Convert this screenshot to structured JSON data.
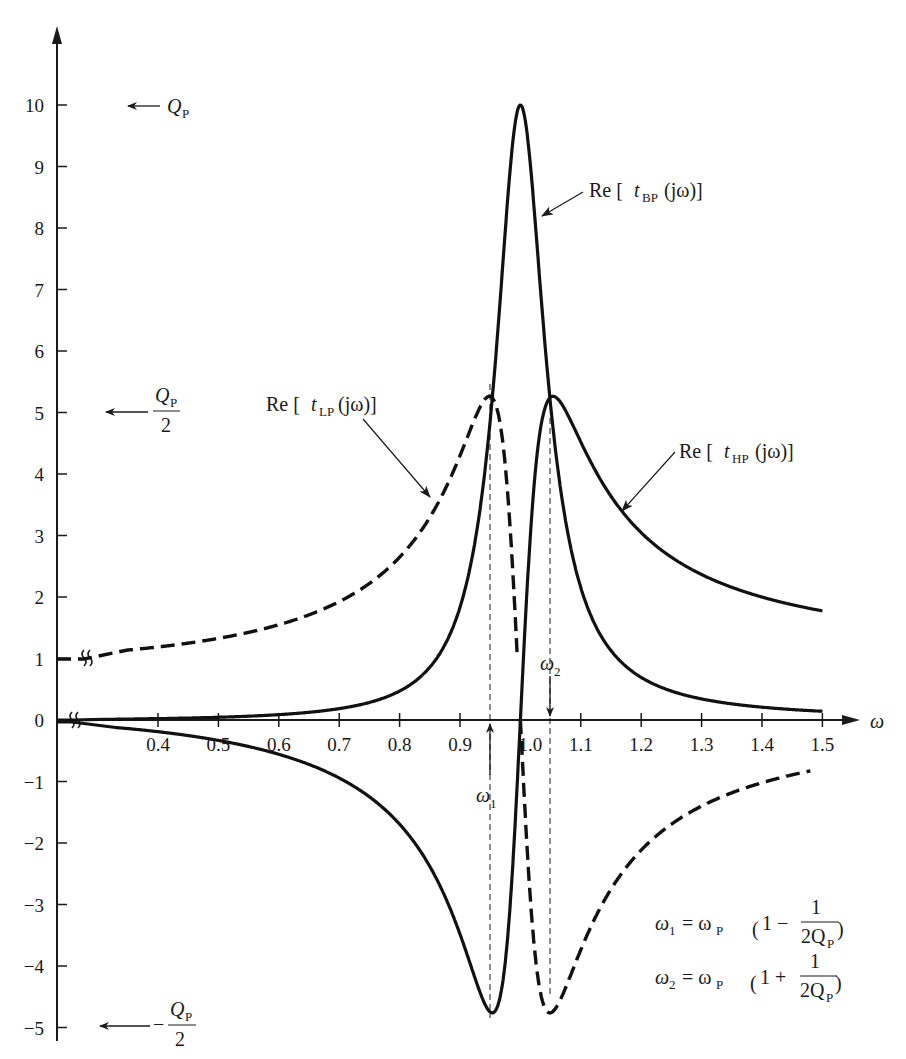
{
  "chart_data": {
    "type": "line",
    "title": "",
    "xlabel": "ω",
    "ylabel": "",
    "xlim": [
      0.3,
      1.55
    ],
    "ylim": [
      -5.2,
      10.8
    ],
    "grid": false,
    "x_ticks": [
      0.4,
      0.5,
      0.6,
      0.7,
      0.8,
      0.9,
      1.0,
      1.1,
      1.2,
      1.3,
      1.4,
      1.5
    ],
    "x_tick_labels": [
      "0.4",
      "0.5",
      "0.6",
      "0.7",
      "0.8",
      "0.9",
      "1.0",
      "1.1",
      "1.2",
      "1.3",
      "1.4",
      "1.5"
    ],
    "y_ticks": [
      -5,
      -4,
      -3,
      -2,
      -1,
      0,
      1,
      2,
      3,
      4,
      5,
      6,
      7,
      8,
      9,
      10
    ],
    "y_tick_labels": [
      "−5",
      "−4",
      "−3",
      "−2",
      "−1",
      "0",
      "1",
      "2",
      "3",
      "4",
      "5",
      "6",
      "7",
      "8",
      "9",
      "10"
    ],
    "Q_P": 10,
    "omega_P": 1.0,
    "series": [
      {
        "name": "Re [t_BP(jω)]",
        "style": "solid",
        "x": [
          0.4,
          0.5,
          0.6,
          0.7,
          0.8,
          0.9,
          0.95,
          1.0,
          1.05,
          1.1,
          1.2,
          1.3,
          1.4,
          1.5
        ],
        "values": [
          0.02,
          0.04,
          0.08,
          0.18,
          0.45,
          1.9,
          4.9,
          10.0,
          4.9,
          2.1,
          0.6,
          0.26,
          0.15,
          0.1
        ]
      },
      {
        "name": "Re [t_LP(jω)]",
        "style": "dashed",
        "x": [
          0.3,
          0.4,
          0.5,
          0.6,
          0.7,
          0.8,
          0.9,
          0.95,
          1.0,
          1.05,
          1.1,
          1.2,
          1.3,
          1.4,
          1.5
        ],
        "values": [
          1.0,
          1.19,
          1.33,
          1.56,
          1.95,
          2.76,
          5.0,
          5.4,
          0.0,
          -4.5,
          -4.5,
          -2.2,
          -1.4,
          -1.0,
          -0.8
        ]
      },
      {
        "name": "Re [t_HP(jω)]",
        "style": "solid",
        "x": [
          0.3,
          0.4,
          0.5,
          0.6,
          0.7,
          0.8,
          0.9,
          0.95,
          1.0,
          1.05,
          1.1,
          1.2,
          1.3,
          1.4,
          1.5
        ],
        "values": [
          -0.1,
          -0.19,
          -0.33,
          -0.56,
          -0.95,
          -1.76,
          -4.05,
          -4.9,
          0.0,
          4.9,
          4.4,
          3.2,
          2.4,
          2.0,
          1.8
        ]
      }
    ],
    "markers": [
      {
        "name": "ω1",
        "x": 0.95
      },
      {
        "name": "ω2",
        "x": 1.05
      }
    ],
    "annotations": [
      {
        "text": "Q_P",
        "at_y": 10
      },
      {
        "text": "Q_P / 2",
        "at_y": 5
      },
      {
        "text": "− Q_P / 2",
        "at_y": -5
      },
      {
        "text": "ω1 = ωP (1 − 1/(2Q_P))"
      },
      {
        "text": "ω2 = ωP (1 + 1/(2Q_P))"
      }
    ]
  },
  "labels": {
    "omega": "ω",
    "omega1": "ω",
    "omega2": "ω",
    "sub1": "1",
    "sub2": "2",
    "re": "Re [",
    "t": "t",
    "bp": "BP",
    "lp": "LP",
    "hp": "HP",
    "jw": "(jω)]",
    "Q": "Q",
    "P": "P",
    "two": "2",
    "minus": "−",
    "eq1_lhs": "= ω",
    "eq_P": "P",
    "eq1_inner": "1 −",
    "eq2_inner": "1 +",
    "one": "1",
    "twoQ": "2Q"
  }
}
